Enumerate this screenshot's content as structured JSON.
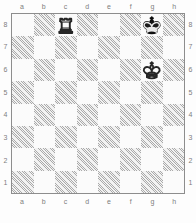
{
  "board": {
    "widget_title": "chess-diagram",
    "orientation": "white",
    "files": [
      "a",
      "b",
      "c",
      "d",
      "e",
      "f",
      "g",
      "h"
    ],
    "ranks": [
      "8",
      "7",
      "6",
      "5",
      "4",
      "3",
      "2",
      "1"
    ],
    "colors": {
      "light_square": "#fbfbfb",
      "dark_square": "#f2f2f2",
      "hatch": "#6e6e6e",
      "border": "#8d8d8d",
      "label": "#7d7d7d",
      "white_piece": "#fafafa",
      "black_piece": "#1b1b1b",
      "page_background": "#fdfdfd"
    },
    "squares": [
      {
        "id": "a8",
        "file": "a",
        "rank": "8",
        "shade": "light",
        "piece": null
      },
      {
        "id": "b8",
        "file": "b",
        "rank": "8",
        "shade": "dark",
        "piece": null
      },
      {
        "id": "c8",
        "file": "c",
        "rank": "8",
        "shade": "light",
        "piece": "white-rook"
      },
      {
        "id": "d8",
        "file": "d",
        "rank": "8",
        "shade": "dark",
        "piece": null
      },
      {
        "id": "e8",
        "file": "e",
        "rank": "8",
        "shade": "light",
        "piece": null
      },
      {
        "id": "f8",
        "file": "f",
        "rank": "8",
        "shade": "dark",
        "piece": null
      },
      {
        "id": "g8",
        "file": "g",
        "rank": "8",
        "shade": "light",
        "piece": "black-king"
      },
      {
        "id": "h8",
        "file": "h",
        "rank": "8",
        "shade": "dark",
        "piece": null
      },
      {
        "id": "a7",
        "file": "a",
        "rank": "7",
        "shade": "dark",
        "piece": null
      },
      {
        "id": "b7",
        "file": "b",
        "rank": "7",
        "shade": "light",
        "piece": null
      },
      {
        "id": "c7",
        "file": "c",
        "rank": "7",
        "shade": "dark",
        "piece": null
      },
      {
        "id": "d7",
        "file": "d",
        "rank": "7",
        "shade": "light",
        "piece": null
      },
      {
        "id": "e7",
        "file": "e",
        "rank": "7",
        "shade": "dark",
        "piece": null
      },
      {
        "id": "f7",
        "file": "f",
        "rank": "7",
        "shade": "light",
        "piece": null
      },
      {
        "id": "g7",
        "file": "g",
        "rank": "7",
        "shade": "dark",
        "piece": null
      },
      {
        "id": "h7",
        "file": "h",
        "rank": "7",
        "shade": "light",
        "piece": null
      },
      {
        "id": "a6",
        "file": "a",
        "rank": "6",
        "shade": "light",
        "piece": null
      },
      {
        "id": "b6",
        "file": "b",
        "rank": "6",
        "shade": "dark",
        "piece": null
      },
      {
        "id": "c6",
        "file": "c",
        "rank": "6",
        "shade": "light",
        "piece": null
      },
      {
        "id": "d6",
        "file": "d",
        "rank": "6",
        "shade": "dark",
        "piece": null
      },
      {
        "id": "e6",
        "file": "e",
        "rank": "6",
        "shade": "light",
        "piece": null
      },
      {
        "id": "f6",
        "file": "f",
        "rank": "6",
        "shade": "dark",
        "piece": null
      },
      {
        "id": "g6",
        "file": "g",
        "rank": "6",
        "shade": "light",
        "piece": "white-king"
      },
      {
        "id": "h6",
        "file": "h",
        "rank": "6",
        "shade": "dark",
        "piece": null
      },
      {
        "id": "a5",
        "file": "a",
        "rank": "5",
        "shade": "dark",
        "piece": null
      },
      {
        "id": "b5",
        "file": "b",
        "rank": "5",
        "shade": "light",
        "piece": null
      },
      {
        "id": "c5",
        "file": "c",
        "rank": "5",
        "shade": "dark",
        "piece": null
      },
      {
        "id": "d5",
        "file": "d",
        "rank": "5",
        "shade": "light",
        "piece": null
      },
      {
        "id": "e5",
        "file": "e",
        "rank": "5",
        "shade": "dark",
        "piece": null
      },
      {
        "id": "f5",
        "file": "f",
        "rank": "5",
        "shade": "light",
        "piece": null
      },
      {
        "id": "g5",
        "file": "g",
        "rank": "5",
        "shade": "dark",
        "piece": null
      },
      {
        "id": "h5",
        "file": "h",
        "rank": "5",
        "shade": "light",
        "piece": null
      },
      {
        "id": "a4",
        "file": "a",
        "rank": "4",
        "shade": "light",
        "piece": null
      },
      {
        "id": "b4",
        "file": "b",
        "rank": "4",
        "shade": "dark",
        "piece": null
      },
      {
        "id": "c4",
        "file": "c",
        "rank": "4",
        "shade": "light",
        "piece": null
      },
      {
        "id": "d4",
        "file": "d",
        "rank": "4",
        "shade": "dark",
        "piece": null
      },
      {
        "id": "e4",
        "file": "e",
        "rank": "4",
        "shade": "light",
        "piece": null
      },
      {
        "id": "f4",
        "file": "f",
        "rank": "4",
        "shade": "dark",
        "piece": null
      },
      {
        "id": "g4",
        "file": "g",
        "rank": "4",
        "shade": "light",
        "piece": null
      },
      {
        "id": "h4",
        "file": "h",
        "rank": "4",
        "shade": "dark",
        "piece": null
      },
      {
        "id": "a3",
        "file": "a",
        "rank": "3",
        "shade": "dark",
        "piece": null
      },
      {
        "id": "b3",
        "file": "b",
        "rank": "3",
        "shade": "light",
        "piece": null
      },
      {
        "id": "c3",
        "file": "c",
        "rank": "3",
        "shade": "dark",
        "piece": null
      },
      {
        "id": "d3",
        "file": "d",
        "rank": "3",
        "shade": "light",
        "piece": null
      },
      {
        "id": "e3",
        "file": "e",
        "rank": "3",
        "shade": "dark",
        "piece": null
      },
      {
        "id": "f3",
        "file": "f",
        "rank": "3",
        "shade": "light",
        "piece": null
      },
      {
        "id": "g3",
        "file": "g",
        "rank": "3",
        "shade": "dark",
        "piece": null
      },
      {
        "id": "h3",
        "file": "h",
        "rank": "3",
        "shade": "light",
        "piece": null
      },
      {
        "id": "a2",
        "file": "a",
        "rank": "2",
        "shade": "light",
        "piece": null
      },
      {
        "id": "b2",
        "file": "b",
        "rank": "2",
        "shade": "dark",
        "piece": null
      },
      {
        "id": "c2",
        "file": "c",
        "rank": "2",
        "shade": "light",
        "piece": null
      },
      {
        "id": "d2",
        "file": "d",
        "rank": "2",
        "shade": "dark",
        "piece": null
      },
      {
        "id": "e2",
        "file": "e",
        "rank": "2",
        "shade": "light",
        "piece": null
      },
      {
        "id": "f2",
        "file": "f",
        "rank": "2",
        "shade": "dark",
        "piece": null
      },
      {
        "id": "g2",
        "file": "g",
        "rank": "2",
        "shade": "light",
        "piece": null
      },
      {
        "id": "h2",
        "file": "h",
        "rank": "2",
        "shade": "dark",
        "piece": null
      },
      {
        "id": "a1",
        "file": "a",
        "rank": "1",
        "shade": "dark",
        "piece": null
      },
      {
        "id": "b1",
        "file": "b",
        "rank": "1",
        "shade": "light",
        "piece": null
      },
      {
        "id": "c1",
        "file": "c",
        "rank": "1",
        "shade": "dark",
        "piece": null
      },
      {
        "id": "d1",
        "file": "d",
        "rank": "1",
        "shade": "light",
        "piece": null
      },
      {
        "id": "e1",
        "file": "e",
        "rank": "1",
        "shade": "dark",
        "piece": null
      },
      {
        "id": "f1",
        "file": "f",
        "rank": "1",
        "shade": "light",
        "piece": null
      },
      {
        "id": "g1",
        "file": "g",
        "rank": "1",
        "shade": "dark",
        "piece": null
      },
      {
        "id": "h1",
        "file": "h",
        "rank": "1",
        "shade": "light",
        "piece": null
      }
    ],
    "pieces": [
      {
        "square": "c8",
        "color": "white",
        "type": "rook",
        "icon": "white-rook-icon"
      },
      {
        "square": "g8",
        "color": "black",
        "type": "king",
        "icon": "black-king-icon"
      },
      {
        "square": "g6",
        "color": "white",
        "type": "king",
        "icon": "white-king-icon"
      }
    ]
  }
}
